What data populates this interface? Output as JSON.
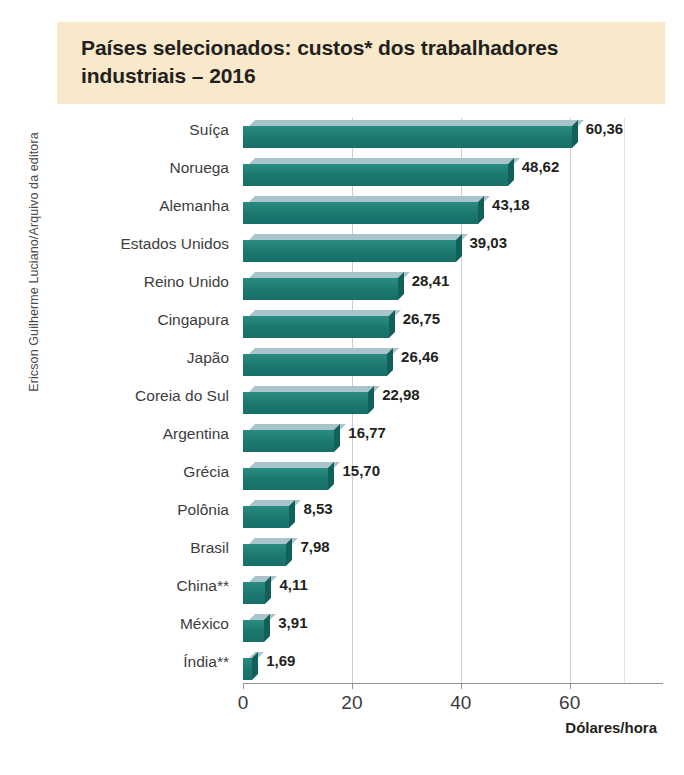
{
  "credit": "Ericson Guilherme Luciano/Arquivo da editora",
  "title": "Países selecionados: custos* dos trabalhadores industriais – 2016",
  "colors": {
    "bar_front": "#1b776e",
    "bar_top": "#a9c4cb",
    "bar_side": "#12605a",
    "title_band": "#f7e9c9",
    "frame": "#f6eedd",
    "gridline": "#c9cfd2",
    "text": "#231f20"
  },
  "chart_data": {
    "type": "bar",
    "orientation": "horizontal",
    "title": "Países selecionados: custos* dos trabalhadores industriais – 2016",
    "xlabel": "Dólares/hora",
    "ylabel": "",
    "xlim": [
      0,
      70
    ],
    "xticks": [
      "0",
      "20",
      "40",
      "60"
    ],
    "xtick_values": [
      0,
      20,
      40,
      60
    ],
    "grid": true,
    "legend": false,
    "categories": [
      "Suíça",
      "Noruega",
      "Alemanha",
      "Estados Unidos",
      "Reino Unido",
      "Cingapura",
      "Japão",
      "Coreia do Sul",
      "Argentina",
      "Grécia",
      "Polônia",
      "Brasil",
      "China**",
      "México",
      "Índia**"
    ],
    "values": [
      60.36,
      48.62,
      43.18,
      39.03,
      28.41,
      26.75,
      26.46,
      22.98,
      16.77,
      15.7,
      8.53,
      7.98,
      4.11,
      3.91,
      1.69
    ],
    "value_labels": [
      "60,36",
      "48,62",
      "43,18",
      "39,03",
      "28,41",
      "26,75",
      "26,46",
      "22,98",
      "16,77",
      "15,70",
      "8,53",
      "7,98",
      "4,11",
      "3,91",
      "1,69"
    ]
  }
}
